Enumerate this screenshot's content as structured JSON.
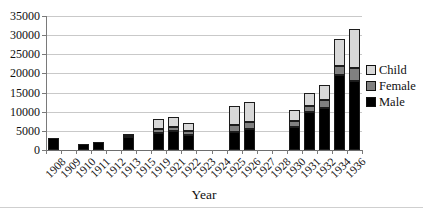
{
  "chart_data": {
    "type": "bar",
    "stacked": true,
    "title": "",
    "xlabel": "Year",
    "ylabel": "",
    "ylim": [
      0,
      35000
    ],
    "y_ticks": [
      0,
      5000,
      10000,
      15000,
      20000,
      25000,
      30000,
      35000
    ],
    "grid": true,
    "grid_color": "#c9c9c9",
    "axis_color": "#6e6e6e",
    "categories": [
      "1908",
      "1909",
      "1910",
      "1911",
      "1912",
      "1913",
      "1915",
      "1919",
      "1921",
      "1922",
      "1923",
      "1924",
      "1925",
      "1926",
      "1927",
      "1928",
      "1930",
      "1931",
      "1932",
      "1934",
      "1936"
    ],
    "series": [
      {
        "name": "Male",
        "color": "#000000",
        "values": [
          3200,
          0,
          1500,
          2000,
          0,
          3500,
          0,
          4500,
          5000,
          3900,
          0,
          0,
          4600,
          5400,
          0,
          0,
          6000,
          10000,
          11000,
          19500,
          18000
        ]
      },
      {
        "name": "Female",
        "color": "#808080",
        "values": [
          0,
          0,
          0,
          0,
          0,
          300,
          0,
          1000,
          1000,
          1100,
          0,
          0,
          2000,
          2000,
          0,
          0,
          1500,
          1500,
          2000,
          2500,
          3500
        ]
      },
      {
        "name": "Child",
        "color": "#d8d8d8",
        "values": [
          0,
          0,
          0,
          0,
          0,
          500,
          0,
          2500,
          2600,
          2100,
          0,
          0,
          4800,
          5200,
          0,
          0,
          3000,
          3500,
          4000,
          7000,
          10000
        ]
      }
    ],
    "legend": {
      "position": "right",
      "entries": [
        "Child",
        "Female",
        "Male"
      ]
    }
  }
}
